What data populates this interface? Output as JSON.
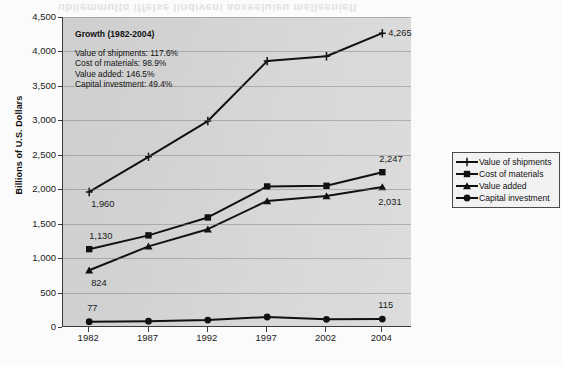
{
  "bleed_text": "ubliemmulto iffelse lindiveni aoseeluieu melleeniefl",
  "axes": {
    "y_title": "Billions of U.S. Dollars",
    "y_ticks": [
      "4,500",
      "4,000",
      "3,500",
      "3,000",
      "2,500",
      "2,000",
      "1,500",
      "1,000",
      "500",
      "0"
    ],
    "x_ticks": [
      "1982",
      "1987",
      "1992",
      "1997",
      "2002",
      "2004"
    ]
  },
  "annotation": {
    "title": "Growth (1982-2004)",
    "lines": [
      "Value of shipments: 117.6%",
      "Cost of materials: 98.9%",
      "Value added: 146.5%",
      "Capital investment: 49.4%"
    ]
  },
  "legend": {
    "items": [
      {
        "label": "Value of shipments",
        "marker": "cross-marker"
      },
      {
        "label": "Cost of materials",
        "marker": "square-marker"
      },
      {
        "label": "Value added",
        "marker": "triangle-marker"
      },
      {
        "label": "Capital investment",
        "marker": "circle-marker"
      }
    ]
  },
  "data_labels": {
    "shipments_start": "1,960",
    "shipments_end": "4,265",
    "materials_start": "1,130",
    "materials_end": "2,247",
    "value_added_start": "824",
    "value_added_end": "2,031",
    "capital_start": "77",
    "capital_end": "115"
  },
  "colors": {
    "line": "#111111",
    "plot_background": "#d6d6d6",
    "page_background": "#fbfbfb",
    "axis": "#3a3a3a"
  },
  "chart_data": {
    "type": "line",
    "title": "",
    "xlabel": "",
    "ylabel": "Billions of U.S. Dollars",
    "categories": [
      "1982",
      "1987",
      "1992",
      "1997",
      "2002",
      "2004"
    ],
    "ylim": [
      0,
      4500
    ],
    "ytick_step": 500,
    "grid": true,
    "legend_position": "right-outside",
    "series": [
      {
        "name": "Value of shipments",
        "marker": "cross",
        "values": [
          1960,
          2470,
          2990,
          3860,
          3930,
          4265
        ]
      },
      {
        "name": "Cost of materials",
        "marker": "square",
        "values": [
          1130,
          1330,
          1590,
          2040,
          2050,
          2247
        ]
      },
      {
        "name": "Value added",
        "marker": "triangle",
        "values": [
          824,
          1170,
          1420,
          1830,
          1900,
          2031
        ]
      },
      {
        "name": "Capital investment",
        "marker": "circle",
        "values": [
          77,
          85,
          100,
          145,
          112,
          115
        ]
      }
    ]
  }
}
